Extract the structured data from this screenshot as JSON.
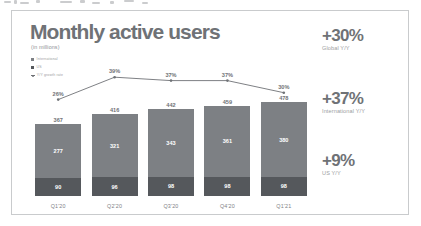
{
  "slide": {
    "title": "Monthly active users",
    "subtitle": "(in millions)"
  },
  "legend": {
    "items": [
      {
        "label": "International",
        "swatch": "intl",
        "color": "#7d8084"
      },
      {
        "label": "US",
        "swatch": "us",
        "color": "#55585c"
      },
      {
        "label": "Y/Y growth rate",
        "swatch": "line",
        "color": "#6f7276"
      }
    ]
  },
  "kpis": [
    {
      "value": "+30%",
      "label": "Global Y/Y"
    },
    {
      "value": "+37%",
      "label": "International Y/Y"
    },
    {
      "value": "+9%",
      "label": "US Y/Y"
    }
  ],
  "chart_data": {
    "type": "bar",
    "title": "Monthly active users",
    "subtitle": "(in millions)",
    "xlabel": "",
    "ylabel": "",
    "stacked": true,
    "grid": false,
    "legend_position": "top-left",
    "categories": [
      "Q1'20",
      "Q2'20",
      "Q3'20",
      "Q4'20",
      "Q1'21"
    ],
    "series": [
      {
        "name": "US",
        "values": [
          90,
          96,
          98,
          98,
          98
        ],
        "color": "#55585c"
      },
      {
        "name": "International",
        "values": [
          277,
          321,
          343,
          361,
          380
        ],
        "color": "#7d8084"
      }
    ],
    "totals": [
      367,
      416,
      442,
      459,
      478
    ],
    "growth_line": {
      "name": "Y/Y growth rate",
      "values": [
        26,
        39,
        37,
        37,
        30
      ],
      "labels": [
        "26%",
        "39%",
        "37%",
        "37%",
        "30%"
      ],
      "color": "#6f7276"
    },
    "ylim": [
      0,
      500
    ]
  }
}
